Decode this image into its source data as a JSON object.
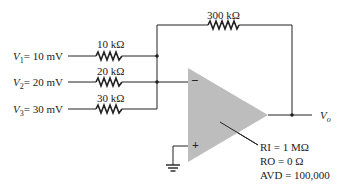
{
  "inputs": [
    {
      "name": "V",
      "sub": "1",
      "value": "= 10 mV",
      "resistor": "10 kΩ"
    },
    {
      "name": "V",
      "sub": "2",
      "value": "= 20 mV",
      "resistor": "20 kΩ"
    },
    {
      "name": "V",
      "sub": "3",
      "value": "= 30 mV",
      "resistor": "30 kΩ"
    }
  ],
  "feedback": {
    "resistor": "300 kΩ"
  },
  "opamp": {
    "minus": "−",
    "plus": "+",
    "fill": "#bdbdbd",
    "params": [
      "RI = 1 MΩ",
      "RO = 0 Ω",
      "AVD = 100,000"
    ]
  },
  "output": {
    "name": "V",
    "sub": "o"
  }
}
